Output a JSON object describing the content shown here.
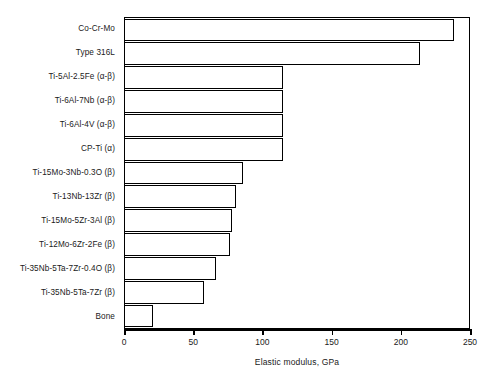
{
  "chart_data": {
    "type": "bar",
    "orientation": "horizontal",
    "title": "",
    "xlabel": "Elastic modulus, GPa",
    "ylabel": "",
    "xlim": [
      0,
      250
    ],
    "xticks": [
      0,
      50,
      100,
      150,
      200,
      250
    ],
    "xtick_labels": [
      "0",
      "50",
      "100",
      "150",
      "200",
      "250"
    ],
    "grid": false,
    "legend": false,
    "categories": [
      "Co-Cr-Mo",
      "Type 316L",
      "Ti-5Al-2.5Fe (α-β)",
      "Ti-6Al-7Nb (α-β)",
      "Ti-6Al-4V (α-β)",
      "CP-Ti (α)",
      "Ti-15Mo-3Nb-0.3O (β)",
      "Ti-13Nb-13Zr (β)",
      "Ti-15Mo-5Zr-3Al (β)",
      "Ti-12Mo-6Zr-2Fe (β)",
      "Ti-35Nb-5Ta-7Zr-0.4O (β)",
      "Ti-35Nb-5Ta-7Zr (β)",
      "Bone"
    ],
    "values": [
      238,
      213,
      114,
      114,
      114,
      114,
      85,
      80,
      77,
      76,
      66,
      57,
      20
    ],
    "bar_facecolor": "#ffffff",
    "bar_edgecolor": "#000000",
    "axis_color": "#000000"
  }
}
